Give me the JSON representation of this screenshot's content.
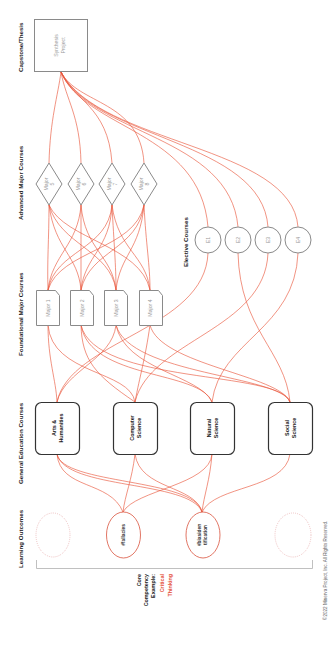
{
  "diagram": {
    "orientation": "rotated-90-ccw",
    "colors": {
      "edge": "#e8543a",
      "highlight_text": "#e4503a",
      "node_border_gray": "#8a8a8a",
      "node_border_dark": "#333333"
    },
    "layers": {
      "capstone": {
        "header": "Capstone/Thesis",
        "nodes": [
          {
            "id": "synthesis",
            "label_lines": [
              "Synthesis",
              "Project"
            ]
          }
        ]
      },
      "advanced": {
        "header": "Advanced Major Courses",
        "nodes": [
          {
            "id": "m5",
            "label_lines": [
              "Major",
              "5"
            ]
          },
          {
            "id": "m6",
            "label_lines": [
              "Major",
              "6"
            ]
          },
          {
            "id": "m7",
            "label_lines": [
              "Major",
              "7"
            ]
          },
          {
            "id": "m8",
            "label_lines": [
              "Major",
              "8"
            ]
          }
        ]
      },
      "elective": {
        "header": "Elective Courses",
        "nodes": [
          {
            "id": "e1",
            "label": "E1"
          },
          {
            "id": "e2",
            "label": "E2"
          },
          {
            "id": "e3",
            "label": "E3"
          },
          {
            "id": "e4",
            "label": "E4"
          }
        ]
      },
      "foundational": {
        "header": "Foundational Major Courses",
        "nodes": [
          {
            "id": "m1",
            "label": "Major 1"
          },
          {
            "id": "m2",
            "label": "Major 2"
          },
          {
            "id": "m3",
            "label": "Major 3"
          },
          {
            "id": "m4",
            "label": "Major 4"
          }
        ]
      },
      "gened": {
        "header": "General Education Courses",
        "nodes": [
          {
            "id": "ah",
            "label_lines": [
              "Arts &",
              "Humanities"
            ]
          },
          {
            "id": "cs",
            "label_lines": [
              "Computer",
              "Science"
            ]
          },
          {
            "id": "ns",
            "label_lines": [
              "Natural",
              "Science"
            ]
          },
          {
            "id": "ss",
            "label_lines": [
              "Social",
              "Science"
            ]
          }
        ]
      },
      "outcomes": {
        "header": "Learning Outcomes",
        "nodes": [
          {
            "id": "o0",
            "label_lines": [],
            "placeholder": true
          },
          {
            "id": "fallacies",
            "label_lines": [
              "#fallacies"
            ]
          },
          {
            "id": "bias",
            "label_lines": [
              "#biasiden",
              "tification"
            ]
          },
          {
            "id": "o3",
            "label_lines": [],
            "placeholder": true
          }
        ]
      }
    },
    "core_competency": {
      "lines": [
        "Core",
        "Competency",
        "Example:"
      ],
      "highlight_lines": [
        "Critical",
        "Thinking"
      ]
    },
    "copyright": "©2022 Minerva Project, Inc. All Rights Reserved."
  }
}
